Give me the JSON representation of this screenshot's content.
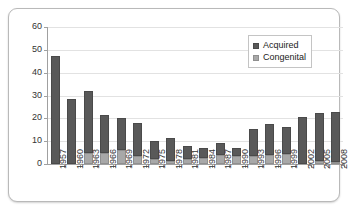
{
  "chart_data": {
    "type": "bar",
    "stacked": true,
    "title": "",
    "subtitle": "",
    "xlabel": "",
    "ylabel": "",
    "ylim": [
      0,
      60
    ],
    "yticks": [
      0,
      10,
      20,
      30,
      40,
      50,
      60
    ],
    "grid": true,
    "legend_position": "top-right",
    "categories": [
      "1957",
      "1960",
      "1963",
      "1966",
      "1969",
      "1972",
      "1975",
      "1978",
      "1981",
      "1984",
      "1987",
      "1990",
      "1993",
      "1996",
      "1999",
      "2002",
      "2005",
      "2008"
    ],
    "series": [
      {
        "name": "Congenital",
        "color": "#a8a8a8",
        "values": [
          0,
          0,
          5,
          5,
          6,
          3.5,
          2,
          1.5,
          2,
          2.5,
          4,
          3.5,
          3.5,
          4,
          4.5,
          0,
          1.5,
          1
        ]
      },
      {
        "name": "Acquired",
        "color": "#595959",
        "values": [
          47.5,
          28.5,
          27,
          16.5,
          14,
          14.5,
          8,
          10,
          6,
          4.5,
          5,
          3.5,
          12,
          13.5,
          11.5,
          20.5,
          21,
          22
        ]
      }
    ],
    "totals": [
      47.5,
      28.5,
      32,
      21.5,
      20,
      18,
      10,
      11.5,
      8,
      7,
      9,
      7,
      15.5,
      17.5,
      16,
      20.5,
      22.5,
      23
    ]
  },
  "legend": {
    "items": [
      {
        "label": "Acquired",
        "color": "#595959"
      },
      {
        "label": "Congenital",
        "color": "#a8a8a8"
      }
    ]
  },
  "axis": {
    "y_tick_labels": [
      "60",
      "50",
      "40",
      "30",
      "20",
      "10",
      "0"
    ]
  }
}
